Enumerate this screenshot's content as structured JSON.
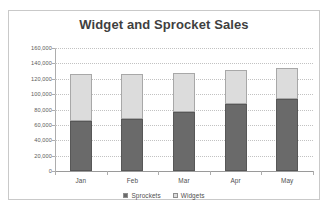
{
  "chart_data": {
    "type": "bar",
    "subtype": "stacked-column",
    "title": "Widget and Sprocket Sales",
    "xlabel": "",
    "ylabel": "",
    "categories": [
      "Jan",
      "Feb",
      "Mar",
      "Apr",
      "May"
    ],
    "series": [
      {
        "name": "Sprockets",
        "color": "#6a6a6a",
        "values": [
          65000,
          68000,
          77000,
          87000,
          94000
        ]
      },
      {
        "name": "Widgets",
        "color": "#dcdcdc",
        "values": [
          61000,
          58000,
          50000,
          45000,
          40000
        ]
      }
    ],
    "totals": [
      126000,
      126000,
      127000,
      132000,
      134000
    ],
    "ylim": [
      0,
      160000
    ],
    "ytick_step": 20000,
    "ytick_labels": [
      "160,000",
      "140,000",
      "120,000",
      "100,000",
      "80,000",
      "60,000",
      "40,000",
      "20,000",
      "0"
    ],
    "ytick_values": [
      160000,
      140000,
      120000,
      100000,
      80000,
      60000,
      40000,
      20000,
      0
    ],
    "grid": true,
    "grid_style": "dotted",
    "grid_color": "#c2c2c2",
    "legend_position": "bottom",
    "legend": [
      "Sprockets",
      "Widgets"
    ],
    "title_color": "#3f3f3f",
    "axis_text_color": "#4f4f4f",
    "frame_color": "#c9c9c9",
    "plot_background": "#ffffff"
  }
}
